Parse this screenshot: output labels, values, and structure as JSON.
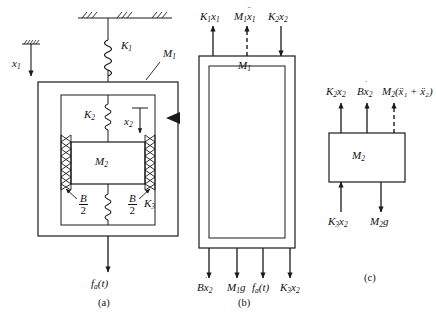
{
  "figure": {
    "panels": [
      {
        "id": "a",
        "letter": "(a)",
        "caption": "(a)"
      },
      {
        "id": "b",
        "letter": "(b)",
        "caption": "(b)"
      },
      {
        "id": "c",
        "letter": "(c)",
        "caption": "(c)"
      }
    ]
  },
  "panel_a": {
    "letter": "(a)",
    "displacement_x1": "x",
    "displacement_x1_sub": "1",
    "displacement_x2": "x",
    "displacement_x2_sub": "2",
    "spring_k1": "K",
    "spring_k1_sub": "1",
    "spring_k2": "K",
    "spring_k2_sub": "2",
    "spring_k3": "K",
    "spring_k3_sub": "3",
    "mass_m1": "M",
    "mass_m1_sub": "1",
    "mass_m2": "M",
    "mass_m2_sub": "2",
    "damper_left_num": "B",
    "damper_left_den": "2",
    "damper_right_num": "B",
    "damper_right_den": "2",
    "applied_force": "f",
    "applied_force_sub": "a",
    "applied_force_arg": "(t)"
  },
  "panel_b": {
    "letter": "(b)",
    "body_label": "M",
    "body_label_sub": "1",
    "forces_top": [
      {
        "name": "K1x1",
        "base": "K",
        "sub1": "1",
        "var": "x",
        "sub2": "1",
        "direction": "up",
        "style": "solid"
      },
      {
        "name": "M1x1ddot",
        "base": "M",
        "sub1": "1",
        "var": "x",
        "sub2": "1",
        "dots": "¨",
        "direction": "up",
        "style": "dashed"
      },
      {
        "name": "K2x2",
        "base": "K",
        "sub1": "2",
        "var": "x",
        "sub2": "2",
        "direction": "down",
        "style": "solid"
      }
    ],
    "forces_bottom": [
      {
        "name": "Bx2dot",
        "base": "B",
        "sub1": "",
        "var": "x",
        "sub2": "2",
        "dots": "˙",
        "direction": "down",
        "style": "solid"
      },
      {
        "name": "M1g",
        "base": "M",
        "sub1": "1",
        "var": "g",
        "sub2": "",
        "direction": "down",
        "style": "solid"
      },
      {
        "name": "fa_t",
        "base": "f",
        "sub1": "a",
        "var": "(t)",
        "sub2": "",
        "direction": "down",
        "style": "solid"
      },
      {
        "name": "K3x2",
        "base": "K",
        "sub1": "3",
        "var": "x",
        "sub2": "2",
        "direction": "down",
        "style": "solid"
      }
    ]
  },
  "panel_c": {
    "letter": "(c)",
    "body_label": "M",
    "body_label_sub": "2",
    "forces_top": [
      {
        "name": "K2x2",
        "base": "K",
        "sub1": "2",
        "var": "x",
        "sub2": "2",
        "direction": "up",
        "style": "solid"
      },
      {
        "name": "Bx2dot",
        "base": "B",
        "sub1": "",
        "var": "x",
        "sub2": "2",
        "dots": "˙",
        "direction": "up",
        "style": "solid"
      },
      {
        "name": "M2_x1ddot_plus_x2ddot",
        "base": "M",
        "sub1": "2",
        "expr": "(ẍ₁ + ẍ₂)",
        "direction": "up",
        "style": "dashed"
      }
    ],
    "forces_bottom": [
      {
        "name": "K3x2",
        "base": "K",
        "sub1": "3",
        "var": "x",
        "sub2": "2",
        "direction": "up",
        "style": "solid"
      },
      {
        "name": "M2g",
        "base": "M",
        "sub1": "2",
        "var": "g",
        "sub2": "",
        "direction": "down",
        "style": "solid"
      }
    ]
  },
  "colors": {
    "line": "#1a1a1a",
    "background": "#ffffff"
  }
}
